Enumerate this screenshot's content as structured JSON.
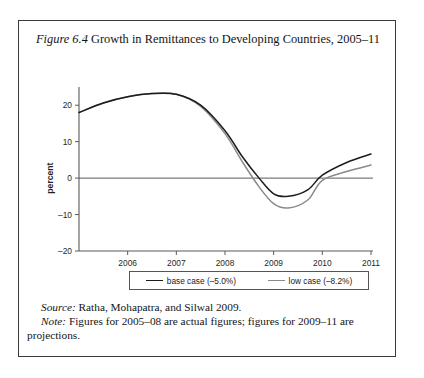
{
  "figure": {
    "label": "Figure 6.4",
    "title_rest": " Growth in Remittances to Developing Countries, 2005–11"
  },
  "legend": {
    "base_label": "base case (–5.0%)",
    "low_label": "low case (–8.2%)",
    "base_color": "#1c1c1c",
    "low_color": "#8a8a8a"
  },
  "footnotes": {
    "source_lead": "Source:",
    "source_text": " Ratha, Mohapatra, and Silwal 2009.",
    "note_lead": "Note:",
    "note_text": " Figures for 2005–08 are actual figures; figures for 2009–11 are",
    "note_text_cont": "projections."
  },
  "chart_data": {
    "type": "line",
    "title": "Growth in Remittances to Developing Countries, 2005–11",
    "xlabel": "",
    "ylabel": "percent",
    "xlim": [
      2005,
      2011
    ],
    "ylim": [
      -20,
      25
    ],
    "yticks": [
      20,
      10,
      0,
      -10,
      -20
    ],
    "ytick_labels": [
      "20",
      "10",
      "0",
      "–10",
      "–20"
    ],
    "xticks": [
      2006,
      2007,
      2008,
      2009,
      2010,
      2011
    ],
    "xtick_labels": [
      "2006",
      "2007",
      "2008",
      "2009",
      "2010",
      "2011"
    ],
    "grid": false,
    "legend_position": "bottom",
    "x": [
      2005,
      2005.5,
      2006,
      2006.5,
      2007,
      2007.5,
      2008,
      2008.35,
      2008.7,
      2009,
      2009.3,
      2009.7,
      2010,
      2010.5,
      2011
    ],
    "series": [
      {
        "name": "base case (–5.0%)",
        "color": "#1c1c1c",
        "values": [
          18.0,
          20.6,
          22.3,
          23.2,
          23.0,
          20.0,
          13.0,
          6.0,
          0.0,
          -4.3,
          -5.0,
          -3.2,
          0.8,
          4.3,
          6.6
        ]
      },
      {
        "name": "low case (–8.2%)",
        "color": "#8a8a8a",
        "values": [
          18.0,
          20.6,
          22.3,
          23.2,
          23.0,
          19.7,
          12.2,
          4.6,
          -2.4,
          -7.0,
          -8.2,
          -6.0,
          -0.6,
          1.8,
          3.6
        ]
      }
    ],
    "annotations": []
  }
}
